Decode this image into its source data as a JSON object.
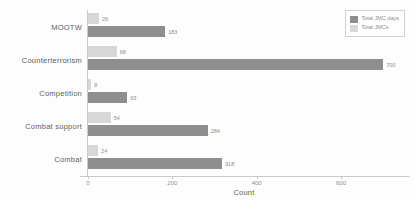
{
  "chart_data": {
    "type": "bar",
    "orientation": "horizontal",
    "title": "",
    "xlabel": "Count",
    "ylabel": "",
    "xlim": [
      0,
      740
    ],
    "xticks": [
      0,
      200,
      400,
      600
    ],
    "xtick_labels": [
      "0",
      "200",
      "400",
      "600"
    ],
    "grid": false,
    "legend_position": "top-right",
    "categories": [
      "MOOTW",
      "Counterterrorism",
      "Competition",
      "Combat support",
      "Combat"
    ],
    "series": [
      {
        "name": "Total JMC days",
        "color": "#8e8e8e",
        "values": [
          183,
          700,
          93,
          284,
          318
        ],
        "labels": [
          "183",
          "700",
          "93",
          "284",
          "318"
        ]
      },
      {
        "name": "Total JMCs",
        "color": "#d7d7d7",
        "values": [
          26,
          68,
          8,
          54,
          24
        ],
        "labels": [
          "26",
          "68",
          "8",
          "54",
          "24"
        ]
      }
    ]
  },
  "legend": {
    "entries": [
      {
        "label": "Total JMC days",
        "color": "#8e8e8e"
      },
      {
        "label": "Total JMCs",
        "color": "#d7d7d7"
      }
    ]
  },
  "axis": {
    "x_title": "Count"
  },
  "colors": {
    "primary_series": "#8e8e8e",
    "secondary_series": "#d7d7d7",
    "axis_line": "#c9c9c9",
    "text": "#5e5e5e",
    "value_text": "#8d8d8d",
    "background": "#fdfdfd"
  }
}
